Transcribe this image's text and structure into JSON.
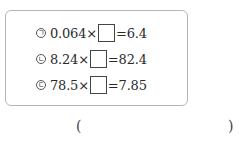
{
  "problems": [
    {
      "marker": "ㄱ",
      "left": "0.064",
      "op": "×",
      "eq": "=",
      "right": "6.4"
    },
    {
      "marker": "ㄴ",
      "left": "8.24",
      "op": "×",
      "eq": "=",
      "right": "82.4"
    },
    {
      "marker": "ㄷ",
      "left": "78.5",
      "op": "×",
      "eq": "=",
      "right": "7.85"
    }
  ],
  "answer": {
    "open": "(",
    "close": ")"
  }
}
